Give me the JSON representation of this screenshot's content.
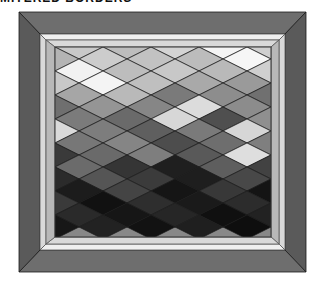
{
  "caption": "MITERED BORDERS",
  "colors": {
    "outer_border": "#6e6e6e",
    "outer_border_dark": "#5a5a5a",
    "inner_border": "#d9d9d9",
    "inner_border_light": "#efefef",
    "inner_border_shadow": "#b8b8b8",
    "seam": "#1a1a1a"
  },
  "geometry": {
    "outer": {
      "x": 19,
      "y": 12,
      "w": 287,
      "h": 260
    },
    "inner": {
      "x": 40,
      "y": 34,
      "w": 245,
      "h": 216
    },
    "field": {
      "x": 55,
      "y": 47,
      "w": 216,
      "h": 190
    },
    "diamond_w": 48,
    "diamond_h": 24
  },
  "diamond_rows": [
    [
      "#c9c9c9",
      "#bdbdbd",
      "#d4d4d4",
      "#f4f4f4",
      "#cfcfcf",
      "#c6c6c6"
    ],
    [
      "#b4b4b4",
      "#cccccc",
      "#c2c2c2",
      "#bcbcbc",
      "#f6f6f6",
      "#c0c0c0",
      "#bdbdbd"
    ],
    [
      "#f2f2f2",
      "#bdbdbd",
      "#c8c8c8",
      "#b9b9b9",
      "#cfcfcf",
      "#bebebe"
    ],
    [
      "#c8c8c8",
      "#f4f4f4",
      "#bfbfbf",
      "#a9a9a9",
      "#9a9a9a",
      "#bdbdbd",
      "#e3e3e3"
    ],
    [
      "#a6a6a6",
      "#b9b9b9",
      "#7a7a7a",
      "#8d8d8d",
      "#707070",
      "#979797"
    ],
    [
      "#6f6f6f",
      "#959595",
      "#868686",
      "#dcdcdc",
      "#8c8c8c",
      "#d9d9d9",
      "#808080"
    ],
    [
      "#7b7b7b",
      "#6a6a6a",
      "#d7d7d7",
      "#4f4f4f",
      "#8f8f8f",
      "#6c6c6c"
    ],
    [
      "#dadada",
      "#7d7d7d",
      "#5f5f5f",
      "#7a7a7a",
      "#d6d6d6",
      "#5a5a5a",
      "#8a8a8a"
    ],
    [
      "#777777",
      "#858585",
      "#4d4d4d",
      "#6e6e6e",
      "#7f7f7f",
      "#e0e0e0"
    ],
    [
      "#3a3a3a",
      "#6a6a6a",
      "#7e7e7e",
      "#595959",
      "#dedede",
      "#535353",
      "#6b6b6b"
    ],
    [
      "#6b6b6b",
      "#353535",
      "#1f1f1f",
      "#5e5e5e",
      "#424242",
      "#2f2f2f"
    ],
    [
      "#2b2b2b",
      "#555555",
      "#3b3b3b",
      "#1e1e1e",
      "#484848",
      "#2a2a2a",
      "#454545"
    ],
    [
      "#1c1c1c",
      "#444444",
      "#151515",
      "#383838",
      "#141414",
      "#333333"
    ],
    [
      "#3a3a3a",
      "#111111",
      "#2e2e2e",
      "#1a1a1a",
      "#2c2c2c",
      "#121212",
      "#383838"
    ],
    [
      "#2a2a2a",
      "#161616",
      "#262626",
      "#101010",
      "#222222",
      "#181818"
    ],
    [
      "#171717",
      "#222222",
      "#121212",
      "#1f1f1f",
      "#0e0e0e",
      "#1b1b1b",
      "#151515"
    ]
  ]
}
